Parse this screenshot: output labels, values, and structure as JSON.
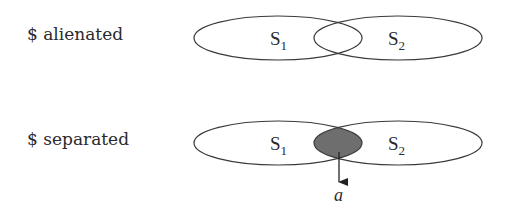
{
  "rows": [
    {
      "label": "$ alienated",
      "set1": {
        "name": "S",
        "sub": "1"
      },
      "set2": {
        "name": "S",
        "sub": "2"
      },
      "intersection_shaded": false
    },
    {
      "label": "$ separated",
      "set1": {
        "name": "S",
        "sub": "1"
      },
      "set2": {
        "name": "S",
        "sub": "2"
      },
      "intersection_shaded": true,
      "arrow_label": "a"
    }
  ],
  "colors": {
    "stroke": "#3a3a3a",
    "shade": "#6e6e6e",
    "text": "#2a2a2a"
  }
}
